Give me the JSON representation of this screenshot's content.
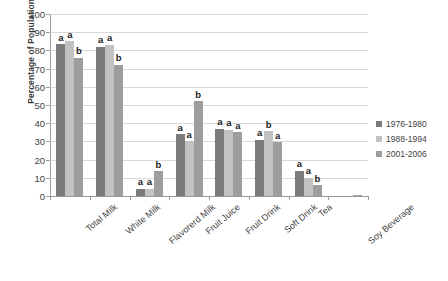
{
  "chart_data": {
    "type": "bar",
    "title": "",
    "xlabel": "",
    "ylabel": "Percentage of Population, %",
    "ylim": [
      0,
      100
    ],
    "ytick_step": 10,
    "ytick_labels": [
      "100",
      "90",
      "80",
      "70",
      "60",
      "50",
      "40",
      "30",
      "20",
      "10",
      "0"
    ],
    "grid": true,
    "legend_position": "right",
    "categories": [
      "Total Milk",
      "White Milk",
      "Flavorerd Milk",
      "Fruit Juice",
      "Fruit Drink",
      "Soft Drink",
      "Tea",
      "Soy Beverage"
    ],
    "series": [
      {
        "name": "1976-1980",
        "color": "#7b7b7b",
        "values": [
          83.5,
          82,
          4,
          34,
          37,
          31,
          14,
          0
        ],
        "annotations": [
          "a",
          "a",
          "a",
          "a",
          "a",
          "a",
          "a",
          ""
        ]
      },
      {
        "name": "1988-1994",
        "color": "#c2c2c2",
        "values": [
          85,
          83,
          4,
          30,
          36.5,
          35.5,
          10,
          0
        ],
        "annotations": [
          "a",
          "a",
          "a",
          "a",
          "a",
          "b",
          "a",
          ""
        ]
      },
      {
        "name": "2001-2006",
        "color": "#9d9d9d",
        "values": [
          76,
          72,
          13.5,
          52,
          35,
          29.5,
          6,
          0.5
        ],
        "annotations": [
          "b",
          "b",
          "b",
          "b",
          "a",
          "a",
          "b",
          ""
        ]
      }
    ]
  }
}
